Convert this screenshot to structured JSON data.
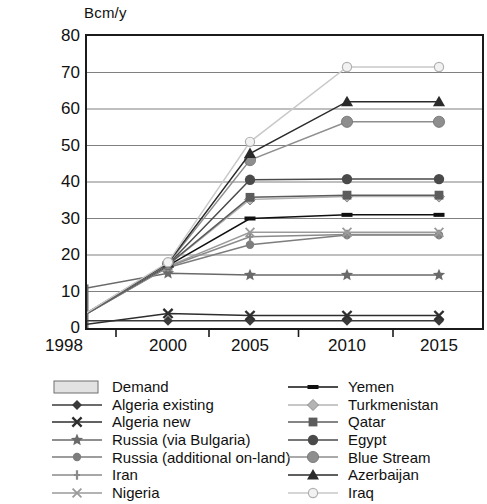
{
  "axis_title": "Bcm/y",
  "legend": {
    "left": [
      {
        "label": "Demand",
        "symbol": "bar-swatch",
        "color": "#e2e2e2"
      },
      {
        "label": "Algeria existing",
        "symbol": "diamond",
        "color": "#3a3a3a"
      },
      {
        "label": "Algeria new",
        "symbol": "cross",
        "color": "#2e2e2e"
      },
      {
        "label": "Russia (via Bulgaria)",
        "symbol": "star",
        "color": "#6a6a6a"
      },
      {
        "label": "Russia (additional on-land)",
        "symbol": "circle",
        "color": "#7d7d7d"
      },
      {
        "label": "Iran",
        "symbol": "plus",
        "color": "#8a8a8a"
      },
      {
        "label": "Nigeria",
        "symbol": "cross-thin",
        "color": "#9a9a9a"
      }
    ],
    "right": [
      {
        "label": "Yemen",
        "symbol": "dash",
        "color": "#101010"
      },
      {
        "label": "Turkmenistan",
        "symbol": "diamond-open",
        "color": "#b4b4b4"
      },
      {
        "label": "Qatar",
        "symbol": "square",
        "color": "#5c5c5c"
      },
      {
        "label": "Egypt",
        "symbol": "circle-dark",
        "color": "#4a4a4a"
      },
      {
        "label": "Blue Stream",
        "symbol": "circle-grey",
        "color": "#8e8e8e"
      },
      {
        "label": "Azerbaijan",
        "symbol": "triangle",
        "color": "#2a2a2a"
      },
      {
        "label": "Iraq",
        "symbol": "circle-open",
        "color": "#c9c9c9"
      }
    ]
  },
  "chart_data": {
    "type": "line",
    "title": "",
    "xlabel": "",
    "ylabel": "Bcm/y",
    "categories": [
      "1998",
      "2000",
      "2005",
      "2010",
      "2015"
    ],
    "ylim": [
      0,
      80
    ],
    "yticks": [
      0,
      10,
      20,
      30,
      40,
      50,
      60,
      70,
      80
    ],
    "grid": true,
    "legend_position": "bottom",
    "bars": {
      "name": "Demand",
      "color": "#e2e2e2",
      "values": [
        11.8,
        17.5,
        39.0,
        44.5,
        44.5
      ]
    },
    "series": [
      {
        "name": "Algeria existing",
        "marker": "diamond",
        "color": "#3a3a3a",
        "values": [
          2.0,
          2.0,
          2.0,
          2.0,
          2.0
        ]
      },
      {
        "name": "Algeria new",
        "marker": "cross",
        "color": "#2e2e2e",
        "values": [
          0.2,
          4.0,
          3.4,
          3.4,
          3.4
        ]
      },
      {
        "name": "Russia (via Bulgaria)",
        "marker": "star",
        "color": "#6a6a6a",
        "values": [
          9.8,
          15.0,
          14.5,
          14.5,
          14.5
        ]
      },
      {
        "name": "Russia (additional on-land)",
        "marker": "circle",
        "color": "#7d7d7d",
        "values": [
          0.3,
          16.6,
          22.8,
          25.5,
          25.5
        ]
      },
      {
        "name": "Iran",
        "marker": "plus",
        "color": "#8a8a8a",
        "values": [
          0.3,
          16.8,
          25.0,
          25.6,
          25.6
        ]
      },
      {
        "name": "Nigeria",
        "marker": "cross-thin",
        "color": "#9a9a9a",
        "values": [
          0.3,
          16.9,
          26.2,
          26.2,
          26.2
        ]
      },
      {
        "name": "Yemen",
        "marker": "dash",
        "color": "#101010",
        "values": [
          0.3,
          17.1,
          30.0,
          31.0,
          31.0
        ]
      },
      {
        "name": "Turkmenistan",
        "marker": "diamond-open",
        "color": "#b4b4b4",
        "values": [
          0.3,
          17.2,
          35.2,
          36.0,
          36.0
        ]
      },
      {
        "name": "Qatar",
        "marker": "square",
        "color": "#5c5c5c",
        "values": [
          0.3,
          17.3,
          35.8,
          36.4,
          36.4
        ]
      },
      {
        "name": "Egypt",
        "marker": "circle-dark",
        "color": "#4a4a4a",
        "values": [
          0.3,
          17.4,
          40.6,
          40.8,
          40.8
        ]
      },
      {
        "name": "Blue Stream",
        "marker": "circle-grey",
        "color": "#8e8e8e",
        "values": [
          0.3,
          17.6,
          46.0,
          56.5,
          56.5
        ]
      },
      {
        "name": "Azerbaijan",
        "marker": "triangle",
        "color": "#2a2a2a",
        "values": [
          0.3,
          17.8,
          47.8,
          62.0,
          62.0
        ]
      },
      {
        "name": "Iraq",
        "marker": "circle-open",
        "color": "#c9c9c9",
        "values": [
          0.3,
          18.0,
          51.0,
          71.5,
          71.5
        ]
      }
    ]
  }
}
